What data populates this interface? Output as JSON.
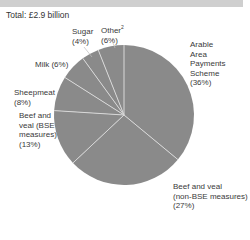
{
  "header": {
    "total_label": "Total: £2.9 billion"
  },
  "colors": {
    "slice": "#8a8a8a",
    "divider": "#d8d8d8",
    "topbar": "#cfcfcf"
  },
  "chart_data": {
    "type": "pie",
    "title": "Total: £2.9 billion",
    "categories": [
      "Arable Area Payments Scheme",
      "Beef and veal (non-BSE measures)",
      "Beef and veal (BSE measures)",
      "Sheepmeat",
      "Milk",
      "Sugar",
      "Other"
    ],
    "values": [
      36,
      27,
      13,
      8,
      6,
      4,
      6
    ],
    "unit": "%",
    "start_angle": "12 o'clock, clockwise",
    "footnote_markers": {
      "Other": "2"
    }
  },
  "labels": {
    "arable": "Arable\nArea\nPayments\nScheme\n(36%)",
    "beef_non_bse": "Beef and veal\n(non-BSE measures)\n(27%)",
    "beef_bse": "Beef and\nveal (BSE\nmeasures)\n(13%)",
    "sheepmeat": "Sheepmeat\n(8%)",
    "milk": "Milk (6%)",
    "sugar": "Sugar\n(4%)",
    "other": "Other",
    "other_sup": "2",
    "other_pct": "(6%)"
  }
}
